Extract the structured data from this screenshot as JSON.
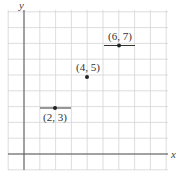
{
  "chart_data": {
    "type": "scatter",
    "title": "",
    "xlabel": "x",
    "ylabel": "y",
    "xlim": [
      -1,
      9
    ],
    "ylim": [
      -1,
      9
    ],
    "grid": true,
    "points": [
      {
        "x": 2,
        "y": 3,
        "label": "(2, 3)",
        "segment": [
          1,
          3
        ],
        "label_pos": "below"
      },
      {
        "x": 4,
        "y": 5,
        "label": "(4, 5)",
        "segment": null,
        "label_pos": "above"
      },
      {
        "x": 6,
        "y": 7,
        "label": "(6, 7)",
        "segment": [
          5,
          7
        ],
        "label_pos": "above"
      }
    ]
  },
  "axes": {
    "x_label": "x",
    "y_label": "y"
  },
  "labels": {
    "p1": "(2, 3)",
    "p2": "(4, 5)",
    "p3": "(6, 7)"
  }
}
